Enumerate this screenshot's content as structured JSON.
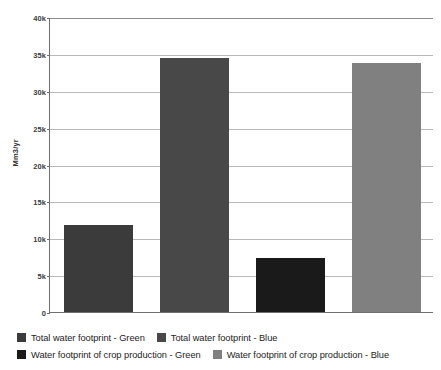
{
  "chart_data": {
    "type": "bar",
    "title": "",
    "subtitle": "",
    "xlabel": "",
    "ylabel": "Mm3/yr",
    "ylim": [
      0,
      40000
    ],
    "grid": true,
    "legend_position": "bottom",
    "categories": [
      "Total water footprint - Green",
      "Total water footprint - Blue",
      "Water footprint of crop production - Green",
      "Water footprint of crop production - Blue"
    ],
    "values": [
      11800,
      34400,
      7300,
      33700
    ],
    "colors": [
      "#3b3b3b",
      "#484848",
      "#1a1a1a",
      "#808080"
    ],
    "tick_labels": [
      "40k",
      "35k",
      "30k",
      "25k",
      "20k",
      "15k",
      "10k",
      "5k",
      "0"
    ],
    "tick_values": [
      40000,
      35000,
      30000,
      25000,
      20000,
      15000,
      10000,
      5000,
      0
    ]
  },
  "axis": {
    "y_title": "Mm3/yr"
  },
  "legend": {
    "items": [
      {
        "label": "Total water footprint - Green",
        "color": "#3b3b3b"
      },
      {
        "label": "Total water footprint - Blue",
        "color": "#484848"
      },
      {
        "label": "Water footprint of crop production - Green",
        "color": "#1a1a1a"
      },
      {
        "label": "Water footprint of crop production - Blue",
        "color": "#808080"
      }
    ]
  }
}
